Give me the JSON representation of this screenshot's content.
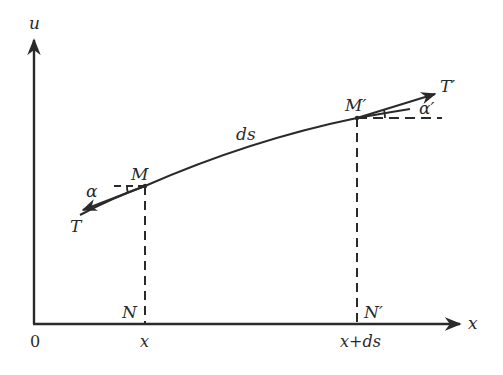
{
  "diagram": {
    "colors": {
      "ink": "#2a2a2a",
      "background": "#ffffff"
    },
    "axes": {
      "y_label": "u",
      "x_label": "x",
      "origin_label": "0"
    },
    "points": {
      "M": {
        "label": "M",
        "foot_label": "N",
        "x_tick_label": "x"
      },
      "M_prime": {
        "label": "M′",
        "foot_label": "N′",
        "x_tick_label": "x+ds"
      }
    },
    "curve_label": "ds",
    "forces": {
      "T_left": {
        "label": "T",
        "angle_label": "α"
      },
      "T_right": {
        "label": "T′",
        "angle_label": "α′"
      }
    }
  }
}
